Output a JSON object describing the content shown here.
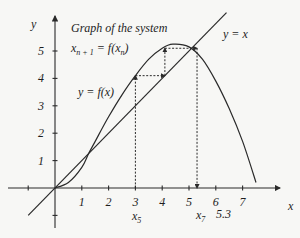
{
  "title": {
    "line1": "Graph of the system",
    "line2_main": "x",
    "line2_sub1": "n + 1",
    "line2_mid": " = f(x",
    "line2_sub2": "n",
    "line2_end": ")"
  },
  "labels": {
    "curve": "y = f(x)",
    "diagonal": "y = x",
    "x_axis": "x",
    "y_axis": "y",
    "x5": "x",
    "x5_sub": "5",
    "x7": "x",
    "x7_sub": "7",
    "fixed_point_value": "5.3"
  },
  "colors": {
    "ink": "#2a2a2a",
    "background": "#f7f7f5"
  },
  "chart_data": {
    "type": "line",
    "xlabel": "x",
    "ylabel": "y",
    "xlim": [
      -1,
      7.5
    ],
    "ylim": [
      -1,
      5.8
    ],
    "x_ticks": [
      -1,
      1,
      2,
      3,
      4,
      5,
      6,
      7
    ],
    "x_tick_labels": [
      "",
      "1",
      "2",
      "3",
      "4",
      "5",
      "6",
      "7"
    ],
    "y_ticks": [
      -1,
      1,
      2,
      3,
      4,
      5
    ],
    "y_tick_labels": [
      "",
      "1",
      "2",
      "3",
      "4",
      "5"
    ],
    "grid": false,
    "series": [
      {
        "name": "y = f(x)",
        "x": [
          0,
          0.5,
          1,
          1.25,
          1.5,
          2,
          2.5,
          3,
          3.5,
          4,
          4.4,
          5,
          5.5,
          6,
          6.5,
          7,
          7.5
        ],
        "y": [
          0,
          0.2,
          0.75,
          1.25,
          1.7,
          2.6,
          3.4,
          4.1,
          4.7,
          5.1,
          5.25,
          5.15,
          4.7,
          3.9,
          2.9,
          1.7,
          0.2
        ]
      },
      {
        "name": "y = x",
        "x": [
          -1,
          6.4
        ],
        "y": [
          -1,
          6.4
        ]
      }
    ],
    "cobweb": [
      [
        3,
        0
      ],
      [
        3,
        4.1
      ],
      [
        4.1,
        4.1
      ],
      [
        4.1,
        5.1
      ],
      [
        5.3,
        5.1
      ],
      [
        5.3,
        0
      ]
    ],
    "annotations": [
      {
        "text": "x_5",
        "x": 3
      },
      {
        "text": "x_7",
        "x": 5.3
      },
      {
        "text": "5.3",
        "x": 5.3
      }
    ]
  }
}
